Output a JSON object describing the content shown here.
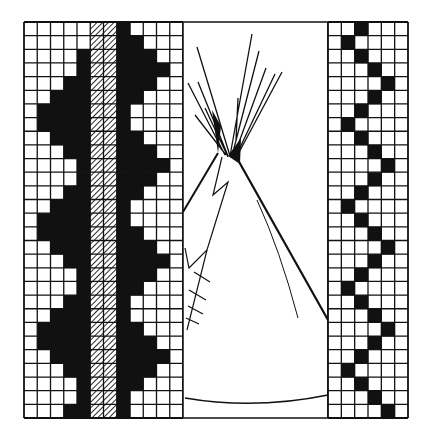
{
  "canvas": {
    "width": 432,
    "height": 439,
    "background": "#ffffff",
    "ink": "#111111"
  },
  "left_panel": {
    "x": 24,
    "y": 22,
    "width": 159,
    "height": 396,
    "cols": 12,
    "rows": 29,
    "hatched_cols": [
      5,
      6
    ],
    "solid_col": 7,
    "left_white_counts": [
      5,
      5,
      4,
      4,
      3,
      2,
      1,
      1,
      2,
      3,
      4,
      4,
      3,
      2,
      1,
      1,
      2,
      3,
      4,
      4,
      3,
      2,
      1,
      1,
      2,
      3,
      4,
      4,
      3
    ],
    "right_black_end": [
      7,
      8,
      9,
      10,
      9,
      8,
      7,
      7,
      8,
      9,
      10,
      9,
      8,
      7,
      7,
      8,
      9,
      10,
      9,
      8,
      7,
      7,
      8,
      9,
      10,
      9,
      8,
      7,
      7
    ]
  },
  "center_panel": {
    "x": 183,
    "y": 22,
    "width": 145,
    "height": 396,
    "subject": "tipi drawing"
  },
  "right_panel": {
    "x": 328,
    "y": 22,
    "width": 80,
    "height": 396,
    "cols": 6,
    "rows": 29,
    "zigzag_pattern": [
      2,
      1,
      2,
      3,
      4,
      3
    ]
  }
}
